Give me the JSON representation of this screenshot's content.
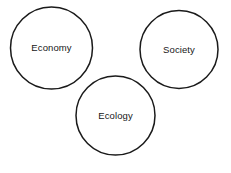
{
  "diagram": {
    "type": "venn-style-circles",
    "title": "",
    "canvas": {
      "width": 231,
      "height": 173,
      "background": "#ffffff"
    },
    "style": {
      "stroke_color": "#1a1a1a",
      "stroke_width": 1.5,
      "fill_color": "#ffffff",
      "label_color": "#171717"
    },
    "nodes": [
      {
        "id": "economy",
        "label": "Economy",
        "cx": 51.5,
        "cy": 48,
        "r": 41,
        "label_x": 51.5,
        "label_y": 48.5
      },
      {
        "id": "society",
        "label": "Society",
        "cx": 179,
        "cy": 49.5,
        "r": 39,
        "label_x": 179,
        "label_y": 50.5
      },
      {
        "id": "ecology",
        "label": "Ecology",
        "cx": 115.5,
        "cy": 115.5,
        "r": 39.5,
        "label_x": 115.5,
        "label_y": 116.5
      }
    ]
  }
}
